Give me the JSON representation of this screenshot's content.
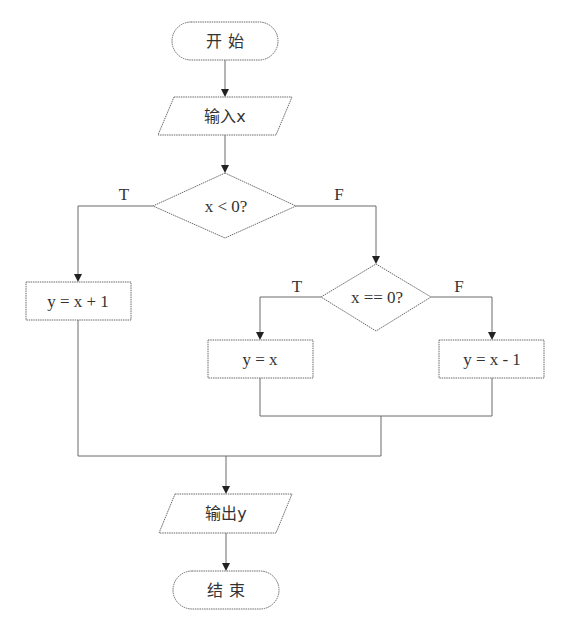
{
  "flowchart": {
    "start": {
      "label": "开 始"
    },
    "input": {
      "label": "输入x"
    },
    "decision1": {
      "label": "x < 0?",
      "true_label": "T",
      "false_label": "F"
    },
    "process_true1": {
      "label": "y = x + 1"
    },
    "decision2": {
      "label": "x == 0?",
      "true_label": "T",
      "false_label": "F"
    },
    "process_true2": {
      "label": "y = x"
    },
    "process_false2": {
      "label": "y = x - 1"
    },
    "output": {
      "label": "输出y"
    },
    "end": {
      "label": "结 束"
    }
  },
  "colors": {
    "stroke": "#6a6a6a",
    "text": "#333333",
    "background": "#ffffff"
  }
}
